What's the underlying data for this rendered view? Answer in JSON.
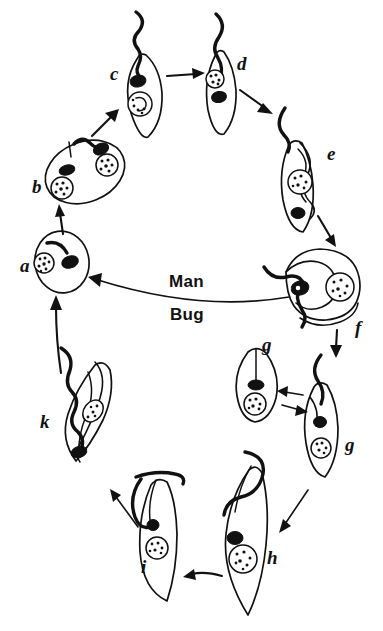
{
  "figure": {
    "kind": "life-cycle-diagram",
    "background_color": "#ffffff",
    "ink_color": "#111111",
    "width": 383,
    "height": 631
  },
  "host_labels": {
    "upper": "Man",
    "lower": "Bug"
  },
  "stages": [
    {
      "id": "a",
      "label": "a",
      "label_x": 20,
      "label_y": 272,
      "region": "man",
      "form": "amastigote",
      "description": "rounded amastigote with nucleus and short internal flagellum"
    },
    {
      "id": "b",
      "label": "b",
      "label_x": 32,
      "label_y": 193,
      "region": "man",
      "form": "dividing-amastigote",
      "description": "oval dividing amastigote with two nuclei and emerging flagellum"
    },
    {
      "id": "c",
      "label": "c",
      "label_x": 110,
      "label_y": 80,
      "region": "man",
      "form": "promastigote",
      "description": "spindle cell with long free anterior flagellum"
    },
    {
      "id": "d",
      "label": "d",
      "label_x": 237,
      "label_y": 70,
      "region": "man",
      "form": "epimastigote",
      "description": "spindle cell, nucleus anterior to kinetoplast"
    },
    {
      "id": "e",
      "label": "e",
      "label_x": 327,
      "label_y": 160,
      "region": "man",
      "form": "trypomastigote",
      "description": "slender cell with undulating membrane and posterior kinetoplast"
    },
    {
      "id": "f",
      "label": "f",
      "label_x": 355,
      "label_y": 334,
      "region": "transition",
      "form": "ingested-trypomastigote",
      "description": "large folded bloodstream trypomastigote taken up by bug"
    },
    {
      "id": "g1",
      "label": "g",
      "label_x": 262,
      "label_y": 351,
      "region": "bug",
      "form": "spheromastigote",
      "description": "rounded intermediate form with internal flagellum"
    },
    {
      "id": "g2",
      "label": "g",
      "label_x": 345,
      "label_y": 451,
      "region": "bug",
      "form": "epimastigote",
      "description": "elongate form convertible with the rounded g stage"
    },
    {
      "id": "h",
      "label": "h",
      "label_x": 267,
      "label_y": 564,
      "region": "bug",
      "form": "epimastigote",
      "description": "long epimastigote with anterior kinetoplast"
    },
    {
      "id": "i",
      "label": "i",
      "label_x": 141,
      "label_y": 573,
      "region": "bug",
      "form": "epimastigote",
      "description": "slender dividing epimastigote"
    },
    {
      "id": "k",
      "label": "k",
      "label_x": 40,
      "label_y": 428,
      "region": "bug",
      "form": "metacyclic-trypomastigote",
      "description": "metacyclic trypomastigote, infective to man"
    }
  ],
  "transitions": [
    {
      "from": "a",
      "to": "b",
      "kind": "single",
      "note": "amastigote enlarges and divides"
    },
    {
      "from": "b",
      "to": "c",
      "kind": "single",
      "note": "flagellum emerges"
    },
    {
      "from": "c",
      "to": "d",
      "kind": "single",
      "note": "kinetoplast migrates"
    },
    {
      "from": "d",
      "to": "e",
      "kind": "single",
      "note": "undulating membrane forms"
    },
    {
      "from": "e",
      "to": "f",
      "kind": "single",
      "note": "bloodstream trypomastigote ingested by bug"
    },
    {
      "from": "f",
      "to": "g2",
      "kind": "single",
      "note": "transformation in bug midgut"
    },
    {
      "from": "g2",
      "to": "g1",
      "kind": "double",
      "note": "reversible interconversion between g forms"
    },
    {
      "from": "g2",
      "to": "h",
      "kind": "single",
      "note": "elongation"
    },
    {
      "from": "h",
      "to": "i",
      "kind": "single",
      "note": "multiplication in hindgut"
    },
    {
      "from": "i",
      "to": "k",
      "kind": "single",
      "note": "metacyclogenesis"
    },
    {
      "from": "k",
      "to": "a",
      "kind": "single",
      "note": "metacyclic form infects man"
    },
    {
      "from": "f",
      "to": "a",
      "kind": "single",
      "note": "long return arrow across the Man / Bug divide"
    }
  ]
}
